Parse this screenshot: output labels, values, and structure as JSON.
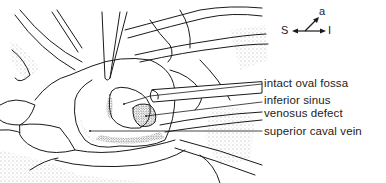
{
  "figure": {
    "type": "anatomical line illustration",
    "view": "surgical view of right atrium",
    "colors": {
      "line": "#1a1a1a",
      "stipple": "#555555",
      "background": "#ffffff"
    }
  },
  "compass": {
    "left": "S",
    "right": "I",
    "diagonal": "a"
  },
  "labels": [
    {
      "text": "intact oval fossa"
    },
    {
      "text_line1": "inferior sinus",
      "text_line2": "venosus defect"
    },
    {
      "text": "superior caval vein"
    }
  ]
}
